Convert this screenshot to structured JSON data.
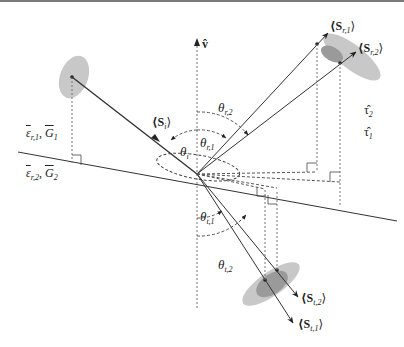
{
  "diagram": {
    "colors": {
      "line": "#333333",
      "dashed": "#555555",
      "ellipse_light": "#c8c8c8",
      "ellipse_dark": "#9a9a9a",
      "top_rule": "#7a7a7a"
    },
    "labels": {
      "normal_vector": "v̂",
      "incident_poynting": "⟨S",
      "incident_sub": "i",
      "reflected_1": "⟨S",
      "reflected_1_sub": "r,1",
      "reflected_2": "⟨S",
      "reflected_2_sub": "r,2",
      "transmitted_1": "⟨S",
      "transmitted_1_sub": "t,1",
      "transmitted_2": "⟨S",
      "transmitted_2_sub": "t,2",
      "close": "⟩",
      "theta": "θ",
      "theta_i_sub": "i",
      "theta_r1_sub": "r,1",
      "theta_r2_sub": "r,2",
      "theta_t1_sub": "t,1",
      "theta_t2_sub": "t,2",
      "tau_2": "τ̂",
      "tau_2_sub": "2",
      "tau_1": "τ̂",
      "tau_1_sub": "1",
      "medium1_eps": "ε",
      "medium1_eps_sub": "r,1",
      "medium1_G": "G",
      "medium1_G_sub": "1",
      "medium2_eps": "ε",
      "medium2_eps_sub": "r,2",
      "medium2_G": "G",
      "medium2_G_sub": "2",
      "comma": ", "
    }
  }
}
